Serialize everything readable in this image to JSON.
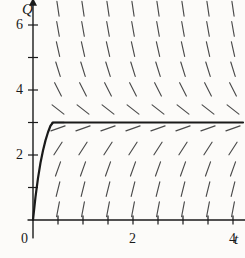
{
  "figure": {
    "name": "direction-field-with-solution-curve",
    "background_color": "#fcfbf9",
    "ink_color": "#1a1a1a",
    "slope_mark_color": "#4a4a4a"
  },
  "axes": {
    "x_axis_label": "t",
    "y_axis_label": "Q",
    "origin_label": "0",
    "x_range": [
      -0.1,
      4.3
    ],
    "y_range": [
      -0.6,
      6.7
    ],
    "x_tick_step": 0.5,
    "y_tick_step": 1,
    "x_tick_values": [
      0.5,
      1,
      1.5,
      2,
      2.5,
      3,
      3.5,
      4
    ],
    "y_tick_values": [
      1,
      2,
      3,
      4,
      5,
      6
    ],
    "x_labeled_ticks": [
      {
        "value": 0,
        "label": "0"
      },
      {
        "value": 2,
        "label": "2"
      },
      {
        "value": 4,
        "label": "4"
      }
    ],
    "y_labeled_ticks": [
      {
        "value": 2,
        "label": "2"
      },
      {
        "value": 4,
        "label": "4"
      },
      {
        "value": 6,
        "label": "6"
      }
    ],
    "grid": false,
    "arrowheads": [
      "x-axis-right",
      "y-axis-top"
    ]
  },
  "chart_data": {
    "type": "line",
    "title": "",
    "xlabel": "t",
    "ylabel": "Q",
    "xlim": [
      -0.1,
      4.3
    ],
    "ylim": [
      -0.6,
      6.7
    ],
    "grid": false,
    "legend": "none",
    "equilibrium": {
      "name": "asymptote",
      "value": 3,
      "style": "solid-horizontal"
    },
    "series": [
      {
        "name": "solution-curve",
        "description": "solution through the origin approaching Q = 3",
        "x": [
          0,
          0.05,
          0.1,
          0.15,
          0.2,
          0.25,
          0.3,
          0.35,
          0.4,
          0.5,
          0.6,
          0.7,
          0.8,
          0.9,
          1.0,
          1.2,
          1.4,
          1.6,
          2.0,
          2.5,
          3.0,
          3.5,
          4.0,
          4.2
        ],
        "y": [
          0,
          0.71,
          1.29,
          1.76,
          2.14,
          2.45,
          2.7,
          2.9,
          3.0,
          3.0,
          3.0,
          3.0,
          3.0,
          3.0,
          3.0,
          3.0,
          3.0,
          3.0,
          3.0,
          3.0,
          3.0,
          3.0,
          3.0,
          3.0
        ]
      }
    ],
    "direction_field": {
      "type": "slope-field",
      "description": "short line segments with slope proportional to (3 - Q)",
      "slope_constant": 3.0,
      "t_columns": [
        0.5,
        1.0,
        1.5,
        2.0,
        2.5,
        3.0,
        3.5,
        4.0
      ],
      "q_rows": [
        0.33,
        0.95,
        1.57,
        2.2,
        2.82,
        3.4,
        4.02,
        4.64,
        5.26,
        5.88,
        6.5
      ],
      "segment_length_px": 15
    }
  }
}
